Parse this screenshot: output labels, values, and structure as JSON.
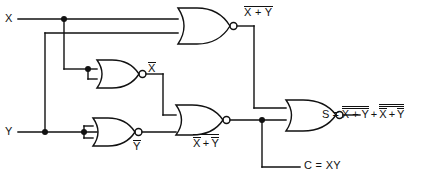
{
  "diagram": {
    "line_color": "#111111",
    "background": "#ffffff",
    "inputs": [
      {
        "id": "x",
        "label": "X"
      },
      {
        "id": "y",
        "label": "Y"
      }
    ],
    "gates": [
      {
        "id": "nor1",
        "type": "NOR",
        "inputs": [
          "X",
          "Y"
        ],
        "output_label_plain": "X + Y",
        "output_overbar": "full"
      },
      {
        "id": "nor2",
        "type": "NOR",
        "inputs": [
          "X",
          "X"
        ],
        "output_label_plain": "X",
        "output_overbar": "full"
      },
      {
        "id": "nor3",
        "type": "NOR",
        "inputs": [
          "Y",
          "Y"
        ],
        "output_label_plain": "Y",
        "output_overbar": "full"
      },
      {
        "id": "nor4",
        "type": "NOR",
        "inputs": [
          "X-bar",
          "Y-bar"
        ],
        "output_label_plain": "X + Y",
        "output_overbar": "terms-and-full"
      },
      {
        "id": "nor5",
        "type": "NOR",
        "inputs": [
          "nor1-out",
          "nor4-out"
        ],
        "output_label_plain": "S",
        "output_overbar": "none"
      }
    ],
    "labels": {
      "input_x": "X",
      "input_y": "Y",
      "nor1_out_terms": "X + Y",
      "nor2_out": "X",
      "nor3_out": "Y",
      "nor4_out_x": "X",
      "nor4_out_plus": "+",
      "nor4_out_y": "Y",
      "sum_prefix": "S =",
      "sum_term1": "X + Y",
      "sum_plus": "+",
      "sum_term2_x": "X",
      "sum_term2_plus": "+",
      "sum_term2_y": "Y",
      "carry": "C = XY"
    },
    "equations": {
      "sum": "S = (X+Y)bar-bar + (Xbar + Ybar)bar-bar",
      "carry": "C = XY"
    }
  }
}
